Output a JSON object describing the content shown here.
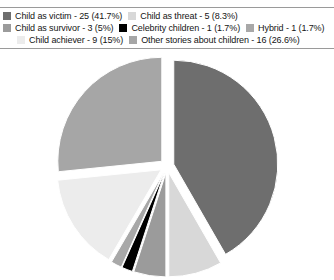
{
  "chart_data": {
    "type": "pie",
    "title": "",
    "legend_position": "top",
    "grid": false,
    "total": 60,
    "categories": [
      "Child as victim",
      "Child as threat",
      "Child as survivor",
      "Celebrity children",
      "Hybrid",
      "Child achiever",
      "Other stories about children"
    ],
    "values": [
      25,
      5,
      3,
      1,
      1,
      9,
      16
    ],
    "percentages": [
      41.7,
      8.3,
      5,
      1.7,
      1.7,
      15,
      26.6
    ],
    "colors": [
      "#6e6e6e",
      "#d8d8d8",
      "#9b9b9b",
      "#000000",
      "#a8a8a8",
      "#ececec",
      "#a6a6a6"
    ],
    "slices": [
      {
        "label": "Child as victim",
        "count": 25,
        "percent": 41.7,
        "color": "#6e6e6e"
      },
      {
        "label": "Child as threat",
        "count": 5,
        "percent": 8.3,
        "color": "#d8d8d8"
      },
      {
        "label": "Child as survivor",
        "count": 3,
        "percent": 5,
        "color": "#9b9b9b"
      },
      {
        "label": "Celebrity children",
        "count": 1,
        "percent": 1.7,
        "color": "#000000"
      },
      {
        "label": "Hybrid",
        "count": 1,
        "percent": 1.7,
        "color": "#a8a8a8"
      },
      {
        "label": "Child achiever",
        "count": 9,
        "percent": 15,
        "color": "#ececec"
      },
      {
        "label": "Other stories about children",
        "count": 16,
        "percent": 26.6,
        "color": "#a6a6a6"
      }
    ]
  },
  "legend": {
    "rows": [
      {
        "entries": [
          {
            "text": "Child as victim - 25 (41.7%)",
            "color": "#6e6e6e",
            "name": "legend-item-child-as-victim"
          },
          {
            "text": "Child as threat - 5 (8.3%)",
            "color": "#d8d8d8",
            "name": "legend-item-child-as-threat"
          }
        ]
      },
      {
        "entries": [
          {
            "text": "Child as survivor - 3 (5%)",
            "color": "#9b9b9b",
            "name": "legend-item-child-as-survivor"
          },
          {
            "text": "Celebrity children - 1 (1.7%)",
            "color": "#000000",
            "name": "legend-item-celebrity-children"
          },
          {
            "text": "Hybrid - 1 (1.7%)",
            "color": "#a8a8a8",
            "name": "legend-item-hybrid"
          }
        ]
      },
      {
        "entries": [
          {
            "text": "Child achiever - 9 (15%)",
            "color": "#ececec",
            "name": "legend-item-child-achiever"
          },
          {
            "text": "Other stories about children - 16 (26.6%)",
            "color": "#a6a6a6",
            "name": "legend-item-other-stories"
          }
        ]
      }
    ]
  }
}
